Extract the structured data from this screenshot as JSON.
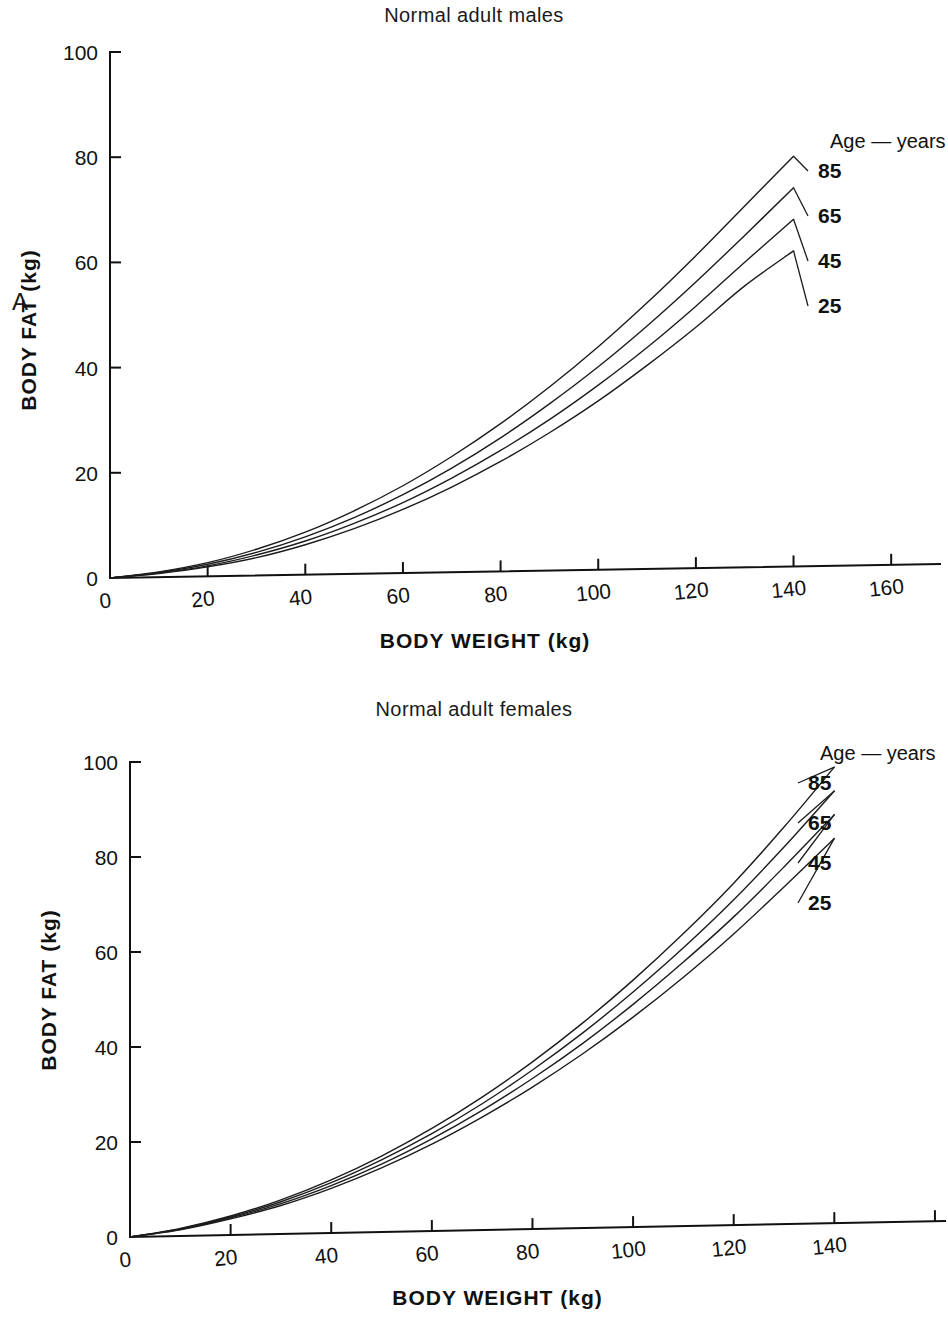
{
  "figure": {
    "panels": [
      {
        "letter": "A",
        "title": "Normal adult males",
        "legend_heading": "Age — years",
        "xlabel": "BODY WEIGHT (kg)",
        "ylabel": "BODY FAT (kg)"
      },
      {
        "letter": "B",
        "title": "Normal adult females",
        "legend_heading": "Age — years",
        "xlabel": "BODY WEIGHT (kg)",
        "ylabel": "BODY FAT (kg)"
      }
    ]
  },
  "chart_data": [
    {
      "type": "line",
      "panel": "A",
      "title": "Normal adult males",
      "xlabel": "BODY WEIGHT (kg)",
      "ylabel": "BODY FAT (kg)",
      "xlim": [
        0,
        170
      ],
      "ylim": [
        0,
        100
      ],
      "xticks": [
        0,
        20,
        40,
        60,
        80,
        100,
        120,
        140,
        160
      ],
      "xtick_labels": [
        "0",
        "20",
        "40",
        "60",
        "80",
        "100",
        "120",
        "140",
        "160"
      ],
      "yticks": [
        0,
        20,
        40,
        60,
        80,
        100
      ],
      "ytick_labels": [
        "0",
        "20",
        "40",
        "60",
        "80",
        "100"
      ],
      "grid": false,
      "legend_position": "upper right",
      "legend_title": "Age — years",
      "x": [
        0,
        10,
        20,
        30,
        40,
        50,
        60,
        70,
        80,
        90,
        100,
        110,
        120,
        130,
        140
      ],
      "series": [
        {
          "name": "85",
          "label": "85",
          "color": "#1c1c1c",
          "values": [
            0,
            1.0,
            2.6,
            5.0,
            8.1,
            12.0,
            16.6,
            22.0,
            28.1,
            34.9,
            42.4,
            50.6,
            59.4,
            68.7,
            78.0
          ]
        },
        {
          "name": "65",
          "label": "65",
          "color": "#1c1c1c",
          "values": [
            0,
            0.9,
            2.3,
            4.4,
            7.2,
            10.7,
            14.9,
            19.8,
            25.4,
            31.7,
            38.6,
            46.2,
            54.4,
            63.1,
            72.0
          ]
        },
        {
          "name": "45",
          "label": "45",
          "color": "#1c1c1c",
          "values": [
            0,
            0.8,
            2.0,
            3.9,
            6.4,
            9.6,
            13.4,
            17.9,
            23.0,
            28.7,
            35.1,
            42.1,
            49.8,
            58.0,
            66.0
          ]
        },
        {
          "name": "25",
          "label": "25",
          "color": "#1c1c1c",
          "values": [
            0,
            0.7,
            1.8,
            3.4,
            5.7,
            8.6,
            12.1,
            16.2,
            20.9,
            26.2,
            32.1,
            38.7,
            45.8,
            53.5,
            60.0
          ]
        }
      ]
    },
    {
      "type": "line",
      "panel": "B",
      "title": "Normal adult females",
      "xlabel": "BODY WEIGHT (kg)",
      "ylabel": "BODY FAT (kg)",
      "xlim": [
        0,
        162
      ],
      "ylim": [
        0,
        100
      ],
      "xticks": [
        0,
        20,
        40,
        60,
        80,
        100,
        120,
        140,
        160
      ],
      "xtick_labels": [
        "0",
        "20",
        "40",
        "60",
        "80",
        "100",
        "120",
        "140",
        ""
      ],
      "yticks": [
        0,
        20,
        40,
        60,
        80,
        100
      ],
      "ytick_labels": [
        "0",
        "20",
        "40",
        "60",
        "80",
        "100"
      ],
      "grid": false,
      "legend_position": "upper right",
      "legend_title": "Age — years",
      "x": [
        0,
        10,
        20,
        30,
        40,
        50,
        60,
        70,
        80,
        90,
        100,
        110,
        120,
        130,
        140
      ],
      "series": [
        {
          "name": "85",
          "label": "85",
          "color": "#1c1c1c",
          "values": [
            0,
            1.6,
            4.0,
            7.2,
            11.2,
            16.0,
            21.6,
            28.0,
            35.2,
            43.2,
            52.0,
            61.6,
            72.0,
            83.6,
            96.0
          ]
        },
        {
          "name": "65",
          "label": "65",
          "color": "#1c1c1c",
          "values": [
            0,
            1.5,
            3.8,
            6.8,
            10.6,
            15.2,
            20.5,
            26.6,
            33.5,
            41.1,
            49.5,
            58.6,
            68.5,
            79.4,
            91.0
          ]
        },
        {
          "name": "45",
          "label": "45",
          "color": "#1c1c1c",
          "values": [
            0,
            1.4,
            3.6,
            6.4,
            10.0,
            14.3,
            19.4,
            25.2,
            31.7,
            38.9,
            46.9,
            55.6,
            64.9,
            75.2,
            86.0
          ]
        },
        {
          "name": "25",
          "label": "25",
          "color": "#1c1c1c",
          "values": [
            0,
            1.3,
            3.4,
            6.0,
            9.4,
            13.5,
            18.3,
            23.8,
            29.9,
            36.7,
            44.2,
            52.4,
            61.3,
            71.0,
            81.0
          ]
        }
      ]
    }
  ]
}
